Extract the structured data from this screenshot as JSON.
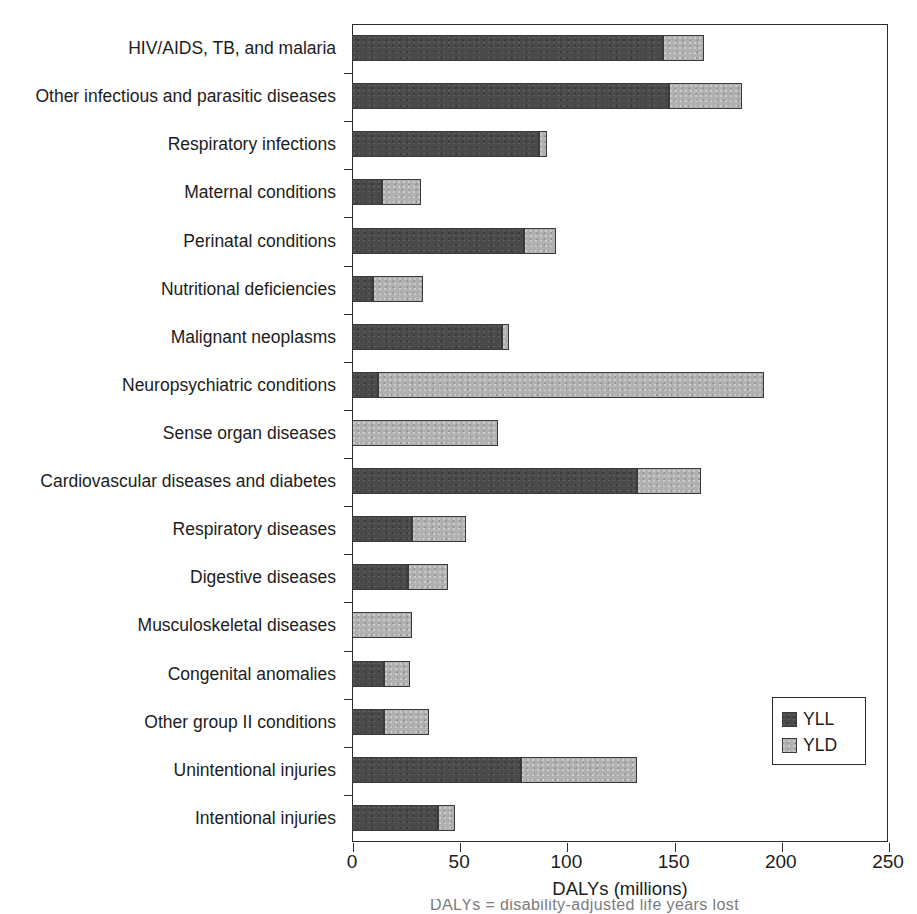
{
  "chart_data": {
    "type": "bar",
    "orientation": "horizontal",
    "stacked": true,
    "title": "",
    "xlabel": "DALYs (millions)",
    "ylabel": "",
    "xlim": [
      0,
      250
    ],
    "xticks": [
      0,
      50,
      100,
      150,
      200,
      250
    ],
    "xticklabels": [
      "0",
      "50",
      "100",
      "150",
      "200",
      "250"
    ],
    "grid": false,
    "legend_position": "lower right",
    "colors": {
      "YLL": "#4a4a4a",
      "YLD": "#b0b0b0",
      "axis": "#2b2b2b",
      "text": "#1c1c1c"
    },
    "legend": [
      {
        "label": "YLL",
        "color": "#4a4a4a"
      },
      {
        "label": "YLD",
        "color": "#b0b0b0"
      }
    ],
    "categories": [
      "HIV/AIDS, TB, and malaria",
      "Other infectious and parasitic diseases",
      "Respiratory infections",
      "Maternal conditions",
      "Perinatal conditions",
      "Nutritional deficiencies",
      "Malignant neoplasms",
      "Neuropsychiatric conditions",
      "Sense organ diseases",
      "Cardiovascular diseases and diabetes",
      "Respiratory diseases",
      "Digestive diseases",
      "Musculoskeletal diseases",
      "Congenital anomalies",
      "Other group II conditions",
      "Unintentional injuries",
      "Intentional injuries"
    ],
    "series": [
      {
        "name": "YLL",
        "values": [
          145,
          148,
          87,
          14,
          80,
          10,
          70,
          12,
          0,
          133,
          28,
          26,
          0,
          15,
          15,
          79,
          40
        ]
      },
      {
        "name": "YLD",
        "values": [
          19,
          34,
          4,
          18,
          15,
          23,
          3,
          180,
          68,
          30,
          25,
          19,
          28,
          12,
          21,
          54,
          8
        ]
      }
    ],
    "totals": [
      164,
      182,
      91,
      32,
      95,
      33,
      73,
      192,
      68,
      163,
      53,
      45,
      28,
      27,
      36,
      133,
      48
    ]
  },
  "caption": {
    "fragment": "DALYs = disability-adjusted life years lost"
  }
}
